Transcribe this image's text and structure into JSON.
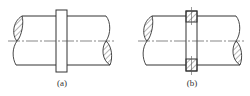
{
  "figure": {
    "type": "engineering drawing: shaft with ring (collar) in two views",
    "colors": {
      "line": "#333333",
      "centerline": "#555555",
      "background": "#ffffff"
    },
    "panels": [
      {
        "id": "a",
        "caption": "(a)",
        "description": "shaft with solid collar ring, external view",
        "shaft": {
          "x1": 14,
          "x2": 110,
          "top": 16,
          "bottom": 65,
          "center": 41
        },
        "ring": {
          "x": 56,
          "y": 10,
          "w": 11,
          "h": 62,
          "sectioned": false
        }
      },
      {
        "id": "b",
        "caption": "(b)",
        "description": "shaft with ring shown in section (hatched cross-sections)",
        "shaft": {
          "x1": 144,
          "x2": 240,
          "top": 16,
          "bottom": 65,
          "center": 41
        },
        "ring": {
          "x": 186,
          "y": 11,
          "w": 11,
          "h": 60,
          "sectioned": true
        }
      }
    ]
  }
}
